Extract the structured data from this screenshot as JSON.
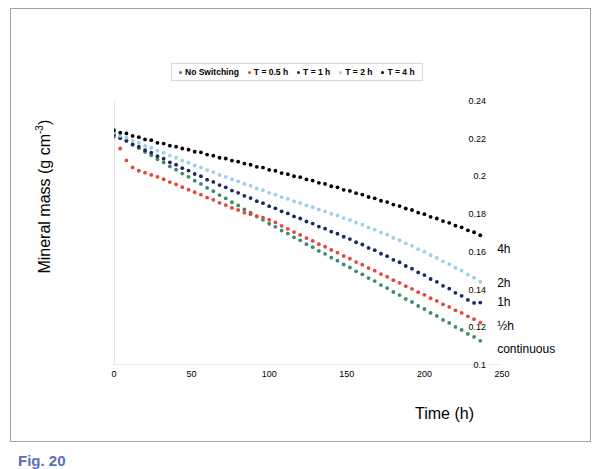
{
  "figure": {
    "caption": "Fig. 20"
  },
  "chart_data": {
    "type": "scatter",
    "title": "",
    "xlabel": "Time (h)",
    "ylabel": "Mineral mass (g cm-3)",
    "ylabel_base": "Mineral mass (g cm",
    "ylabel_sup": "-3",
    "ylabel_tail": ")",
    "xlim": [
      0,
      250
    ],
    "ylim": [
      0.1,
      0.24
    ],
    "xticks": [
      0,
      50,
      100,
      150,
      200,
      250
    ],
    "yticks": [
      0.1,
      0.12,
      0.14,
      0.16,
      0.18,
      0.2,
      0.22,
      0.24
    ],
    "ytick_labels": [
      "0.1",
      "0.12",
      "0.14",
      "0.16",
      "0.18",
      "0.2",
      "0.22",
      "0.24"
    ],
    "xtick_labels": [
      "0",
      "50",
      "100",
      "150",
      "200",
      "250"
    ],
    "grid": false,
    "legend_position": "top",
    "legend_entries": [
      {
        "label": "No Switching",
        "color": "#3d8a6e"
      },
      {
        "label": "T = 0.5 h",
        "color": "#e8443a"
      },
      {
        "label": "T = 1 h",
        "color": "#1b2a63"
      },
      {
        "label": "T = 2 h",
        "color": "#9ad0ea"
      },
      {
        "label": "T = 4 h",
        "color": "#000000"
      }
    ],
    "annotations": [
      {
        "text": "4h",
        "x": 243,
        "y": 0.161
      },
      {
        "text": "2h",
        "x": 243,
        "y": 0.143
      },
      {
        "text": "1h",
        "x": 243,
        "y": 0.133
      },
      {
        "text": "½h",
        "x": 243,
        "y": 0.12
      },
      {
        "text": "continuous",
        "x": 243,
        "y": 0.108
      }
    ],
    "series": [
      {
        "name": "T = 4 h",
        "color": "#000000",
        "marker": "circle",
        "x": [
          0,
          4,
          8,
          12,
          16,
          20,
          24,
          28,
          32,
          36,
          40,
          44,
          48,
          52,
          56,
          60,
          64,
          68,
          72,
          76,
          80,
          84,
          88,
          92,
          96,
          100,
          104,
          108,
          112,
          116,
          120,
          124,
          128,
          132,
          136,
          140,
          144,
          148,
          152,
          156,
          160,
          164,
          168,
          172,
          176,
          180,
          184,
          188,
          192,
          196,
          200,
          204,
          208,
          212,
          216,
          220,
          224,
          228,
          232,
          236
        ],
        "y": [
          0.2245,
          0.2232,
          0.2228,
          0.2215,
          0.2208,
          0.2196,
          0.2192,
          0.2178,
          0.2174,
          0.2163,
          0.2158,
          0.2148,
          0.2142,
          0.2131,
          0.2128,
          0.2116,
          0.211,
          0.2099,
          0.2095,
          0.2084,
          0.2078,
          0.2068,
          0.2062,
          0.2051,
          0.2047,
          0.2035,
          0.203,
          0.2018,
          0.2012,
          0.2001,
          0.1996,
          0.1984,
          0.1978,
          0.1966,
          0.196,
          0.1948,
          0.1942,
          0.1929,
          0.1923,
          0.1911,
          0.1904,
          0.1891,
          0.1884,
          0.1871,
          0.1864,
          0.1851,
          0.1843,
          0.183,
          0.1822,
          0.1808,
          0.18,
          0.1786,
          0.1777,
          0.1763,
          0.1754,
          0.1739,
          0.173,
          0.1714,
          0.1704,
          0.1688
        ]
      },
      {
        "name": "T = 2 h",
        "color": "#9ad0ea",
        "marker": "circle",
        "x": [
          0,
          4,
          8,
          12,
          16,
          20,
          24,
          28,
          32,
          36,
          40,
          44,
          48,
          52,
          56,
          60,
          64,
          68,
          72,
          76,
          80,
          84,
          88,
          92,
          96,
          100,
          104,
          108,
          112,
          116,
          120,
          124,
          128,
          132,
          136,
          140,
          144,
          148,
          152,
          156,
          160,
          164,
          168,
          172,
          176,
          180,
          184,
          188,
          192,
          196,
          200,
          204,
          208,
          212,
          216,
          220,
          224,
          228,
          232,
          236
        ],
        "y": [
          0.2232,
          0.2215,
          0.2205,
          0.2188,
          0.2178,
          0.2162,
          0.2152,
          0.2136,
          0.2126,
          0.211,
          0.2099,
          0.2084,
          0.2073,
          0.2058,
          0.2048,
          0.2033,
          0.2023,
          0.2008,
          0.1998,
          0.1984,
          0.1974,
          0.196,
          0.195,
          0.1936,
          0.1927,
          0.1913,
          0.1904,
          0.189,
          0.1881,
          0.1868,
          0.1859,
          0.1846,
          0.1837,
          0.1824,
          0.1815,
          0.1802,
          0.1793,
          0.1779,
          0.1769,
          0.1755,
          0.1744,
          0.1729,
          0.1718,
          0.1702,
          0.1691,
          0.1674,
          0.1662,
          0.1645,
          0.1632,
          0.1614,
          0.1601,
          0.1582,
          0.1568,
          0.1549,
          0.1535,
          0.1515,
          0.15,
          0.1479,
          0.1463,
          0.1441
        ]
      },
      {
        "name": "T = 1 h",
        "color": "#1b2a63",
        "marker": "circle",
        "x": [
          0,
          4,
          8,
          12,
          16,
          20,
          24,
          28,
          32,
          36,
          40,
          44,
          48,
          52,
          56,
          60,
          64,
          68,
          72,
          76,
          80,
          84,
          88,
          92,
          96,
          100,
          104,
          108,
          112,
          116,
          120,
          124,
          128,
          132,
          136,
          140,
          144,
          148,
          152,
          156,
          160,
          164,
          168,
          172,
          176,
          180,
          184,
          188,
          192,
          196,
          200,
          204,
          208,
          212,
          216,
          220,
          224,
          228,
          232,
          236
        ],
        "y": [
          0.2222,
          0.2203,
          0.219,
          0.2171,
          0.2158,
          0.2139,
          0.2126,
          0.2107,
          0.2094,
          0.2075,
          0.2062,
          0.2044,
          0.2031,
          0.2013,
          0.2001,
          0.1983,
          0.1971,
          0.1954,
          0.1942,
          0.1925,
          0.1913,
          0.1897,
          0.1885,
          0.1869,
          0.1858,
          0.1842,
          0.1831,
          0.1815,
          0.1804,
          0.1788,
          0.1777,
          0.1761,
          0.175,
          0.1734,
          0.1723,
          0.1707,
          0.1696,
          0.168,
          0.1668,
          0.1651,
          0.1639,
          0.1621,
          0.1609,
          0.159,
          0.1577,
          0.1558,
          0.1545,
          0.1525,
          0.1511,
          0.1491,
          0.1477,
          0.1456,
          0.1441,
          0.142,
          0.1405,
          0.1383,
          0.1367,
          0.1345,
          0.1329,
          0.1331
        ]
      },
      {
        "name": "T = 0.5 h",
        "color": "#e8443a",
        "marker": "circle",
        "x": [
          0,
          4,
          8,
          12,
          16,
          20,
          24,
          28,
          32,
          36,
          40,
          44,
          48,
          52,
          56,
          60,
          64,
          68,
          72,
          76,
          80,
          84,
          88,
          92,
          96,
          100,
          104,
          108,
          112,
          116,
          120,
          124,
          128,
          132,
          136,
          140,
          144,
          148,
          152,
          156,
          160,
          164,
          168,
          172,
          176,
          180,
          184,
          188,
          192,
          196,
          200,
          204,
          208,
          212,
          216,
          220,
          224,
          228,
          232,
          236
        ],
        "y": [
          0.221,
          0.2148,
          0.2085,
          0.2048,
          0.203,
          0.202,
          0.2008,
          0.1998,
          0.1985,
          0.197,
          0.1958,
          0.1943,
          0.193,
          0.1916,
          0.1903,
          0.1888,
          0.1876,
          0.186,
          0.1848,
          0.1833,
          0.1822,
          0.1808,
          0.18,
          0.179,
          0.1782,
          0.177,
          0.1756,
          0.1738,
          0.1722,
          0.1705,
          0.169,
          0.1673,
          0.1658,
          0.1641,
          0.1627,
          0.161,
          0.1596,
          0.1578,
          0.1564,
          0.1546,
          0.1532,
          0.1514,
          0.15,
          0.1482,
          0.1468,
          0.145,
          0.1436,
          0.1418,
          0.1404,
          0.1386,
          0.1372,
          0.1354,
          0.134,
          0.1322,
          0.1308,
          0.129,
          0.1276,
          0.1258,
          0.1243,
          0.1225
        ]
      },
      {
        "name": "No Switching",
        "color": "#3d8a6e",
        "marker": "circle",
        "x": [
          0,
          4,
          8,
          12,
          16,
          20,
          24,
          28,
          32,
          36,
          40,
          44,
          48,
          52,
          56,
          60,
          64,
          68,
          72,
          76,
          80,
          84,
          88,
          92,
          96,
          100,
          104,
          108,
          112,
          116,
          120,
          124,
          128,
          132,
          136,
          140,
          144,
          148,
          152,
          156,
          160,
          164,
          168,
          172,
          176,
          180,
          184,
          188,
          192,
          196,
          200,
          204,
          208,
          212,
          216,
          220,
          224,
          228,
          232,
          236
        ],
        "y": [
          0.2228,
          0.2206,
          0.2188,
          0.2167,
          0.215,
          0.2129,
          0.2112,
          0.2091,
          0.2074,
          0.2053,
          0.2036,
          0.2015,
          0.1998,
          0.1977,
          0.196,
          0.1939,
          0.1922,
          0.1901,
          0.1884,
          0.1863,
          0.1846,
          0.1825,
          0.1808,
          0.1787,
          0.177,
          0.1749,
          0.1733,
          0.1713,
          0.1697,
          0.1677,
          0.1661,
          0.1641,
          0.1625,
          0.1605,
          0.1589,
          0.1569,
          0.1553,
          0.1533,
          0.1517,
          0.1497,
          0.1481,
          0.1461,
          0.1445,
          0.1424,
          0.1408,
          0.1387,
          0.1371,
          0.135,
          0.1334,
          0.1313,
          0.1297,
          0.1276,
          0.126,
          0.1239,
          0.1223,
          0.1202,
          0.1186,
          0.1165,
          0.1149,
          0.1128
        ]
      }
    ]
  }
}
